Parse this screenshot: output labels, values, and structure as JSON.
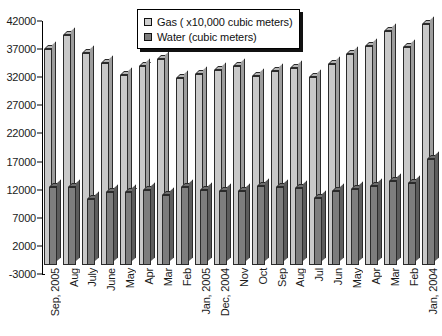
{
  "chart_data": {
    "type": "bar",
    "title": "",
    "xlabel": "",
    "ylabel": "",
    "ylim": [
      -3000,
      42000
    ],
    "grid": false,
    "legend_position": "top-center",
    "ytick_labels": [
      "42000",
      "37000",
      "32000",
      "27000",
      "22000",
      "17000",
      "12000",
      "7000",
      "2000",
      "-3000"
    ],
    "ytick_values": [
      42000,
      37000,
      32000,
      27000,
      22000,
      17000,
      12000,
      7000,
      2000,
      -3000
    ],
    "categories": [
      "Sep, 2005",
      "Aug",
      "July",
      "June",
      "May",
      "Apr",
      "Mar",
      "Feb",
      "Jan, 2005",
      "Dec, 2004",
      "Nov",
      "Oct",
      "Sep",
      "Aug",
      "Jul",
      "Jun",
      "May",
      "Apr",
      "Mar",
      "Feb",
      "Jan, 2004"
    ],
    "series": [
      {
        "name": "Gas ( x10,000 cubic meters)",
        "color": "#c9c9c9",
        "values": [
          37000,
          39500,
          36300,
          34500,
          32400,
          34000,
          35300,
          31800,
          32500,
          33300,
          34000,
          32200,
          33100,
          33600,
          32000,
          34300,
          36200,
          37600,
          40300,
          37300,
          41400
        ]
      },
      {
        "name": "Water (cubic meters)",
        "color": "#7d7d7d",
        "values": [
          12500,
          12400,
          10300,
          11600,
          11500,
          11900,
          11000,
          12400,
          12000,
          11800,
          11700,
          12700,
          12500,
          12300,
          10500,
          11700,
          12100,
          12600,
          13500,
          13200,
          17500
        ]
      }
    ]
  },
  "legend": {
    "items": [
      {
        "label": "Gas ( x10,000 cubic meters)",
        "swatch_class": "gas-sw"
      },
      {
        "label": "Water (cubic meters)",
        "swatch_class": "water-sw"
      }
    ]
  }
}
